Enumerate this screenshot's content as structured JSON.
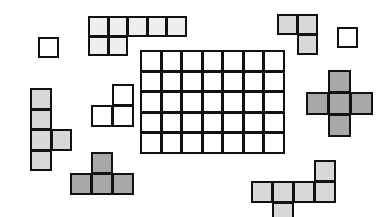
{
  "scene": {
    "title": "Polyomino puzzle pieces around a rectangular grid board",
    "canvas": {
      "width": 391,
      "height": 217,
      "background": "#ffffff"
    },
    "stroke_color": "#111111",
    "palette": {
      "white": "#ffffff",
      "very_light_gray": "#eeeeee",
      "light_gray": "#d8d8d8",
      "medium_gray": "#a8a8a8"
    }
  },
  "board": {
    "name": "central-grid-board",
    "columns": 7,
    "rows": 5,
    "x": 140,
    "y": 50,
    "cell_size": 20.5,
    "fill": "#ffffff",
    "label": "7 x 5 grid board"
  },
  "pieces": [
    {
      "id": "single-square-top-left",
      "label": "single square",
      "cells": 1,
      "x": 38,
      "y": 37,
      "cell_size": 20,
      "fill": "#ffffff",
      "coords": [
        [
          0,
          0
        ]
      ]
    },
    {
      "id": "seven-cell-top-bar",
      "label": "seven-cell L bar",
      "cells": 7,
      "x": 88,
      "y": 16,
      "cell_size": 19.5,
      "fill": "#eeeeee",
      "coords": [
        [
          0,
          0
        ],
        [
          1,
          0
        ],
        [
          2,
          0
        ],
        [
          3,
          0
        ],
        [
          4,
          0
        ],
        [
          0,
          1
        ],
        [
          1,
          1
        ]
      ]
    },
    {
      "id": "l-tromino-top-right",
      "label": "L tromino",
      "cells": 3,
      "x": 277,
      "y": 14,
      "cell_size": 20,
      "fill": "#d8d8d8",
      "coords": [
        [
          0,
          0
        ],
        [
          1,
          0
        ],
        [
          1,
          1
        ]
      ]
    },
    {
      "id": "single-square-far-right",
      "label": "single square",
      "cells": 1,
      "x": 337,
      "y": 27,
      "cell_size": 20,
      "fill": "#ffffff",
      "coords": [
        [
          0,
          0
        ]
      ]
    },
    {
      "id": "plus-pentomino-right",
      "label": "plus pentomino",
      "cells": 5,
      "x": 306,
      "y": 70,
      "cell_size": 22,
      "fill": "#a8a8a8",
      "coords": [
        [
          1,
          0
        ],
        [
          0,
          1
        ],
        [
          1,
          1
        ],
        [
          2,
          1
        ],
        [
          1,
          2
        ]
      ]
    },
    {
      "id": "vertical-pentomino-left",
      "label": "vertical five-cell piece",
      "cells": 5,
      "x": 30,
      "y": 88,
      "cell_size": 20.5,
      "fill": "#d8d8d8",
      "coords": [
        [
          0,
          0
        ],
        [
          0,
          1
        ],
        [
          0,
          2
        ],
        [
          1,
          2
        ],
        [
          0,
          3
        ]
      ]
    },
    {
      "id": "s-tromino-middle-left",
      "label": "S tromino",
      "cells": 3,
      "x": 91,
      "y": 84,
      "cell_size": 21,
      "fill": "#ffffff",
      "coords": [
        [
          1,
          0
        ],
        [
          0,
          1
        ],
        [
          1,
          1
        ]
      ]
    },
    {
      "id": "t-tetromino-bottom-left",
      "label": "T tetromino",
      "cells": 4,
      "x": 70,
      "y": 152,
      "cell_size": 21,
      "fill": "#a8a8a8",
      "coords": [
        [
          1,
          0
        ],
        [
          0,
          1
        ],
        [
          1,
          1
        ],
        [
          2,
          1
        ]
      ]
    },
    {
      "id": "six-cell-bottom-right",
      "label": "six-cell piece",
      "cells": 6,
      "x": 251,
      "y": 160,
      "cell_size": 21,
      "fill": "#d8d8d8",
      "coords": [
        [
          3,
          0
        ],
        [
          0,
          1
        ],
        [
          1,
          1
        ],
        [
          2,
          1
        ],
        [
          3,
          1
        ],
        [
          1,
          2
        ]
      ]
    }
  ]
}
